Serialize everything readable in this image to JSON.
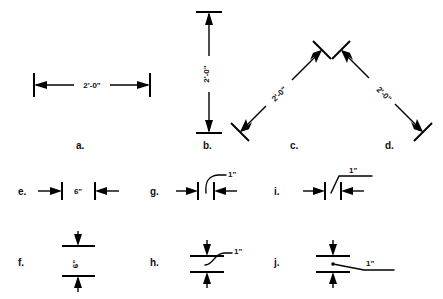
{
  "figure": {
    "background_color": "#ffffff",
    "ink_color": "#000000"
  },
  "items": [
    {
      "id": "a",
      "label": "a.",
      "dimension_text": "2'-0\"",
      "orientation": "horizontal",
      "terminator": "arrowheads-outside-in",
      "leader": "none",
      "text_placement": "inline-centered"
    },
    {
      "id": "b",
      "label": "b.",
      "dimension_text": "2'-0\"",
      "orientation": "vertical",
      "terminator": "arrowheads-outside-in",
      "leader": "none",
      "text_placement": "inline-rotated"
    },
    {
      "id": "c",
      "label": "c.",
      "dimension_text": "2'-0\"",
      "orientation": "diagonal-up-right",
      "terminator": "arrowheads-outside-in",
      "leader": "none",
      "text_placement": "aligned-rotated"
    },
    {
      "id": "d",
      "label": "d.",
      "dimension_text": "2'-0\"",
      "orientation": "diagonal-down-right",
      "terminator": "arrowheads-outside-in",
      "leader": "none",
      "text_placement": "aligned-rotated"
    },
    {
      "id": "e",
      "label": "e.",
      "dimension_text": "6\"",
      "orientation": "horizontal",
      "terminator": "arrowheads-outside",
      "leader": "none",
      "text_placement": "inline-between-extensions"
    },
    {
      "id": "f",
      "label": "f.",
      "dimension_text": "6\"",
      "orientation": "vertical",
      "terminator": "arrowheads-outside",
      "leader": "none",
      "text_placement": "inline-rotated-between-extensions"
    },
    {
      "id": "g",
      "label": "g.",
      "dimension_text": "1\"",
      "orientation": "horizontal",
      "terminator": "arrowheads-outside",
      "leader": "curved",
      "text_placement": "leader-upper-right"
    },
    {
      "id": "h",
      "label": "h.",
      "dimension_text": "1\"",
      "orientation": "vertical",
      "terminator": "arrowheads-outside",
      "leader": "curved-s",
      "text_placement": "leader-upper-right"
    },
    {
      "id": "i",
      "label": "i.",
      "dimension_text": "1\"",
      "orientation": "horizontal",
      "terminator": "arrowheads-outside",
      "leader": "straight-with-shelf",
      "text_placement": "leader-shelf-above"
    },
    {
      "id": "j",
      "label": "j.",
      "dimension_text": "1\"",
      "orientation": "vertical",
      "terminator": "arrowheads-outside",
      "leader": "straight-with-shelf-dot",
      "text_placement": "leader-shelf-right"
    }
  ]
}
